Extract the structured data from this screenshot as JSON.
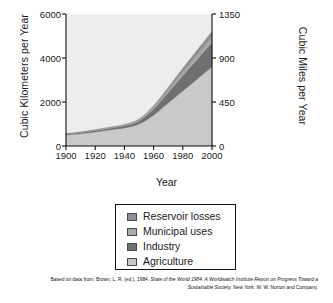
{
  "axes": {
    "ylabel_left": "Cubic Kilometers per Year",
    "ylabel_right": "Cubic Miles per Year",
    "xlabel": "Year",
    "yticks_left": [
      "0",
      "2000",
      "4000",
      "6000"
    ],
    "yticks_right": [
      "0",
      "450",
      "900",
      "1350"
    ],
    "xticks": [
      "1900",
      "1920",
      "1940",
      "1960",
      "1980",
      "2000"
    ]
  },
  "legend": {
    "items": [
      {
        "label": "Reservoir losses",
        "color": "#8f8f8f"
      },
      {
        "label": "Municipal uses",
        "color": "#a8a8a8"
      },
      {
        "label": "Industry",
        "color": "#707070"
      },
      {
        "label": "Agriculture",
        "color": "#c9c9c9"
      }
    ]
  },
  "caption": {
    "line1_pre": "Based on data from: Brown, L. R. (ed.), 1984. ",
    "line1_italic": "State of the World 1984: A Worldwatch Institute Report on Progress Toward a",
    "line2_italic": "Sustainable Society.",
    "line2_post": " New York: W. W. Norton and Company."
  },
  "chart_data": {
    "type": "area",
    "title": "",
    "xlabel": "Year",
    "ylabel": "Cubic Kilometers per Year",
    "ylabel_secondary": "Cubic Miles per Year",
    "xlim": [
      1900,
      2000
    ],
    "ylim": [
      0,
      6000
    ],
    "ylim_secondary": [
      0,
      1350
    ],
    "grid": false,
    "stacked": true,
    "legend_position": "below-plot",
    "x": [
      1900,
      1910,
      1920,
      1930,
      1940,
      1950,
      1960,
      1970,
      1980,
      1990,
      2000
    ],
    "series": [
      {
        "name": "Agriculture",
        "color": "#c9c9c9",
        "values": [
          500,
          560,
          640,
          730,
          820,
          1000,
          1400,
          1950,
          2500,
          3050,
          3600
        ]
      },
      {
        "name": "Industry",
        "color": "#707070",
        "values": [
          40,
          50,
          65,
          80,
          100,
          140,
          280,
          480,
          700,
          900,
          1100
        ]
      },
      {
        "name": "Municipal uses",
        "color": "#a8a8a8",
        "values": [
          15,
          18,
          22,
          28,
          35,
          50,
          80,
          120,
          170,
          210,
          250
        ]
      },
      {
        "name": "Reservoir losses",
        "color": "#8f8f8f",
        "values": [
          5,
          7,
          10,
          14,
          20,
          35,
          70,
          110,
          160,
          210,
          250
        ]
      }
    ],
    "totals": [
      560,
      635,
      737,
      852,
      975,
      1225,
      1830,
      2660,
      3530,
      4370,
      5200
    ]
  }
}
